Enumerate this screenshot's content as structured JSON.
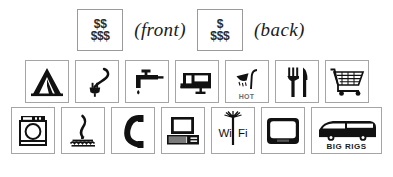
{
  "legend": {
    "price_ratings": [
      {
        "id": "front",
        "line1": "$$",
        "line2": "$$$",
        "label": "(front)"
      },
      {
        "id": "back",
        "line1": "$",
        "line2": "$$$",
        "label": "(back)"
      }
    ]
  },
  "icons": {
    "row1": [
      {
        "name": "tent-icon",
        "alt": "Tent camping"
      },
      {
        "name": "electric-plug-icon",
        "alt": "Electric hookup"
      },
      {
        "name": "water-faucet-icon",
        "alt": "Water hookup"
      },
      {
        "name": "rv-trailer-icon",
        "alt": "RV / trailer sites"
      },
      {
        "name": "hot-shower-icon",
        "alt": "Hot showers",
        "caption": "HOT"
      },
      {
        "name": "fork-knife-icon",
        "alt": "Restaurant / food"
      },
      {
        "name": "shopping-cart-icon",
        "alt": "Store / groceries"
      }
    ],
    "row2": [
      {
        "name": "washing-machine-icon",
        "alt": "Laundry"
      },
      {
        "name": "boat-ramp-icon",
        "alt": "Boat launch / water access"
      },
      {
        "name": "telephone-icon",
        "alt": "Telephone"
      },
      {
        "name": "computer-icon",
        "alt": "Computer / internet"
      },
      {
        "name": "wifi-icon",
        "alt": "Wireless internet",
        "caption_left": "Wi",
        "caption_right": "Fi"
      },
      {
        "name": "television-icon",
        "alt": "Television / cable"
      },
      {
        "name": "big-rigs-bus-icon",
        "alt": "Big rigs welcome",
        "caption": "BIG RIGS"
      }
    ]
  },
  "colors": {
    "ink": "#111111",
    "box_border": "#a5a5a5",
    "page_background": "#ffffff",
    "caption_gray": "#6d6d6d"
  }
}
